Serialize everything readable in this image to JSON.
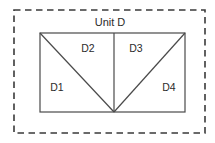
{
  "figure": {
    "title": "Unit D",
    "background_color": "#ffffff",
    "outer_boundary": {
      "style": "dashed",
      "color": "#3a3a3a",
      "x": 14,
      "y": 10,
      "width": 191,
      "height": 123
    },
    "unit_rectangle": {
      "style": "solid",
      "color": "#4a4a4a",
      "x": 40,
      "y": 33,
      "width": 145,
      "height": 79
    },
    "vertex_bottom_center": {
      "x": 114,
      "y": 112
    },
    "divider_vertical": {
      "x": 114,
      "y1": 33,
      "y2": 112
    },
    "diagonals": [
      {
        "name": "left-diagonal",
        "x1": 40,
        "y1": 33,
        "x2": 114,
        "y2": 112
      },
      {
        "name": "right-diagonal",
        "x1": 185,
        "y1": 33,
        "x2": 114,
        "y2": 112
      }
    ],
    "regions": [
      {
        "id": "D1",
        "label": "D1",
        "x": 57,
        "y": 91
      },
      {
        "id": "D2",
        "label": "D2",
        "x": 88,
        "y": 52
      },
      {
        "id": "D3",
        "label": "D3",
        "x": 136,
        "y": 52
      },
      {
        "id": "D4",
        "label": "D4",
        "x": 169,
        "y": 91
      }
    ],
    "title_position": {
      "x": 110,
      "y": 26
    }
  }
}
